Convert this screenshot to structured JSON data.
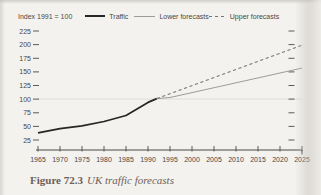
{
  "page": {
    "caption_label": "Figure 72.3",
    "caption_title": "UK traffic forecasts"
  },
  "legend": {
    "index_label": "Index 1991 = 100",
    "items": [
      {
        "label": "Traffic"
      },
      {
        "label": "Lower forecasts"
      },
      {
        "label": "Upper forecasts"
      }
    ]
  },
  "chart_data": {
    "type": "line",
    "title": "UK traffic forecasts",
    "ylabel": "Index 1991 = 100",
    "xlabel": "",
    "xlim": [
      1965,
      2025
    ],
    "ylim": [
      25,
      225
    ],
    "x_ticks": [
      1965,
      1970,
      1975,
      1980,
      1985,
      1990,
      1995,
      2000,
      2005,
      2010,
      2015,
      2020,
      2025
    ],
    "y_ticks": [
      25,
      50,
      75,
      100,
      125,
      150,
      175,
      200,
      225
    ],
    "reference_line_y": 100,
    "grid": false,
    "legend_position": "top",
    "series": [
      {
        "name": "Traffic",
        "style": "solid",
        "color": "#262626",
        "width": 1.7,
        "points": [
          [
            1965,
            38
          ],
          [
            1970,
            46
          ],
          [
            1975,
            51
          ],
          [
            1980,
            59
          ],
          [
            1985,
            70
          ],
          [
            1990,
            94
          ],
          [
            1992,
            101
          ]
        ]
      },
      {
        "name": "Lower forecasts",
        "style": "solid",
        "color": "#9c9c9c",
        "width": 1,
        "points": [
          [
            1992,
            101
          ],
          [
            1995,
            103
          ],
          [
            2025,
            157
          ]
        ]
      },
      {
        "name": "Upper forecasts",
        "style": "dashed",
        "color": "#767676",
        "width": 1.1,
        "points": [
          [
            1992,
            101
          ],
          [
            2025,
            199
          ]
        ]
      }
    ]
  },
  "colors": {
    "page_background": "#f4f2ee",
    "text": "#474747",
    "axis": "#4a4a4a",
    "caption": "#6c6158",
    "reference_line": "#dadada"
  }
}
